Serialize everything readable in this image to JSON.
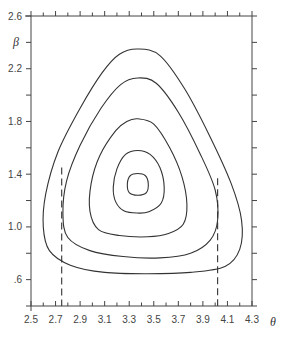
{
  "chart_data": {
    "type": "line",
    "subtype": "contour",
    "title": "",
    "xlabel": "θ",
    "ylabel": "β",
    "xlim": [
      2.5,
      4.3
    ],
    "ylim": [
      0.4,
      2.6
    ],
    "grid": false,
    "x_ticks": [
      2.5,
      2.7,
      2.9,
      3.1,
      3.3,
      3.5,
      3.7,
      3.9,
      4.1,
      4.3
    ],
    "x_tick_labels": [
      "2.5",
      "2.7",
      "2.9",
      "3.1",
      "3.3",
      "3.5",
      "3.7",
      "3.9",
      "4.1",
      "4.3"
    ],
    "x_minor_step": 0.1,
    "y_ticks": [
      0.6,
      1.0,
      1.4,
      1.8,
      2.2,
      2.6
    ],
    "y_tick_labels": [
      ".6",
      "1.0",
      "1.4",
      "1.8",
      "2.2",
      "2.6"
    ],
    "y_minor_step": 0.2,
    "contours": [
      {
        "name": "contour-innermost",
        "points": [
          [
            3.37,
            1.405
          ],
          [
            3.43,
            1.39
          ],
          [
            3.455,
            1.33
          ],
          [
            3.44,
            1.26
          ],
          [
            3.37,
            1.24
          ],
          [
            3.3,
            1.26
          ],
          [
            3.285,
            1.33
          ],
          [
            3.31,
            1.39
          ]
        ]
      },
      {
        "name": "contour-4",
        "points": [
          [
            3.37,
            1.58
          ],
          [
            3.47,
            1.55
          ],
          [
            3.55,
            1.45
          ],
          [
            3.585,
            1.3
          ],
          [
            3.56,
            1.18
          ],
          [
            3.46,
            1.115
          ],
          [
            3.37,
            1.105
          ],
          [
            3.26,
            1.12
          ],
          [
            3.19,
            1.19
          ],
          [
            3.17,
            1.3
          ],
          [
            3.2,
            1.44
          ],
          [
            3.27,
            1.55
          ]
        ]
      },
      {
        "name": "contour-3",
        "points": [
          [
            3.37,
            1.82
          ],
          [
            3.5,
            1.78
          ],
          [
            3.63,
            1.6
          ],
          [
            3.73,
            1.38
          ],
          [
            3.77,
            1.17
          ],
          [
            3.74,
            1.02
          ],
          [
            3.62,
            0.95
          ],
          [
            3.45,
            0.925
          ],
          [
            3.22,
            0.935
          ],
          [
            3.05,
            0.98
          ],
          [
            2.98,
            1.12
          ],
          [
            2.99,
            1.33
          ],
          [
            3.06,
            1.54
          ],
          [
            3.19,
            1.73
          ],
          [
            3.28,
            1.8
          ]
        ]
      },
      {
        "name": "contour-2",
        "points": [
          [
            3.37,
            2.13
          ],
          [
            3.52,
            2.09
          ],
          [
            3.7,
            1.87
          ],
          [
            3.88,
            1.55
          ],
          [
            4.0,
            1.28
          ],
          [
            4.02,
            1.05
          ],
          [
            3.96,
            0.9
          ],
          [
            3.8,
            0.8
          ],
          [
            3.55,
            0.765
          ],
          [
            3.25,
            0.775
          ],
          [
            2.98,
            0.82
          ],
          [
            2.8,
            0.92
          ],
          [
            2.76,
            1.1
          ],
          [
            2.79,
            1.35
          ],
          [
            2.9,
            1.62
          ],
          [
            3.07,
            1.9
          ],
          [
            3.23,
            2.08
          ]
        ]
      },
      {
        "name": "contour-outer",
        "points": [
          [
            3.37,
            2.35
          ],
          [
            3.55,
            2.3
          ],
          [
            3.75,
            2.05
          ],
          [
            3.95,
            1.7
          ],
          [
            4.13,
            1.33
          ],
          [
            4.215,
            1.05
          ],
          [
            4.2,
            0.83
          ],
          [
            4.08,
            0.7
          ],
          [
            3.8,
            0.655
          ],
          [
            3.45,
            0.645
          ],
          [
            3.1,
            0.655
          ],
          [
            2.82,
            0.71
          ],
          [
            2.65,
            0.82
          ],
          [
            2.6,
            1.0
          ],
          [
            2.62,
            1.25
          ],
          [
            2.72,
            1.57
          ],
          [
            2.9,
            1.9
          ],
          [
            3.08,
            2.17
          ],
          [
            3.22,
            2.31
          ]
        ]
      }
    ],
    "reference_lines": [
      {
        "name": "dashed-line-left",
        "x": 2.75,
        "y_from": 0.4,
        "y_to": 1.45,
        "style": "dashed"
      },
      {
        "name": "dashed-line-right",
        "x": 4.02,
        "y_from": 0.4,
        "y_to": 1.37,
        "style": "dashed"
      }
    ]
  }
}
